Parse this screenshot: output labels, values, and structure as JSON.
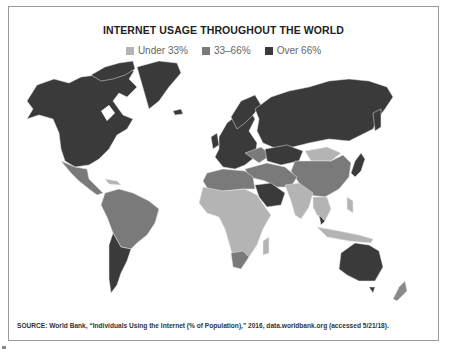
{
  "title": "INTERNET USAGE THROUGHOUT THE WORLD",
  "legend": {
    "items": [
      {
        "label": "Under 33%",
        "color": "#b4b4b4"
      },
      {
        "label": "33–66%",
        "color": "#7a7a7a"
      },
      {
        "label": "Over 66%",
        "color": "#3a3a3a"
      }
    ]
  },
  "source": "SOURCE: World Bank, “Individuals Using the Internet (% of Population),” 2016, data.worldbank.org (accessed 5/21/18).",
  "colors": {
    "low": "#b4b4b4",
    "mid": "#7a7a7a",
    "high": "#3a3a3a",
    "border": "#9a9a9a"
  },
  "regions": [
    {
      "name": "North America (US, Canada)",
      "category": "Over 66%"
    },
    {
      "name": "Greenland",
      "category": "Over 66%"
    },
    {
      "name": "Mexico & Central America",
      "category": "33–66%"
    },
    {
      "name": "South America (Brazil, Colombia, Peru, etc.)",
      "category": "33–66%"
    },
    {
      "name": "Argentina & Chile",
      "category": "Over 66%"
    },
    {
      "name": "Europe",
      "category": "Over 66%"
    },
    {
      "name": "Russia",
      "category": "Over 66%"
    },
    {
      "name": "Kazakhstan",
      "category": "Over 66%"
    },
    {
      "name": "China",
      "category": "33–66%"
    },
    {
      "name": "Mongolia",
      "category": "Under 33%"
    },
    {
      "name": "Japan & South Korea",
      "category": "Over 66%"
    },
    {
      "name": "India & South Asia",
      "category": "Under 33%"
    },
    {
      "name": "Middle East (Saudi Arabia, Gulf)",
      "category": "Over 66%"
    },
    {
      "name": "Turkey & Iran",
      "category": "33–66%"
    },
    {
      "name": "North Africa",
      "category": "33–66%"
    },
    {
      "name": "Sub-Saharan Africa",
      "category": "Under 33%"
    },
    {
      "name": "South Africa",
      "category": "33–66%"
    },
    {
      "name": "Southeast Asia",
      "category": "Under 33%"
    },
    {
      "name": "Malaysia",
      "category": "Over 66%"
    },
    {
      "name": "Australia",
      "category": "Over 66%"
    },
    {
      "name": "New Zealand",
      "category": "Over 66%"
    }
  ]
}
